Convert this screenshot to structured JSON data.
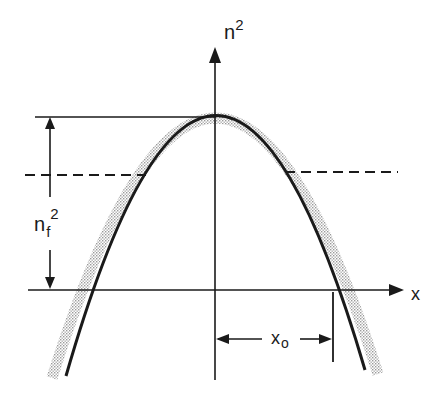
{
  "diagram": {
    "type": "refractive-index-profile",
    "labels": {
      "vertical_axis": "n",
      "vertical_axis_sup": "2",
      "horizontal_axis": "x",
      "left_dimension": "n",
      "left_dimension_sub": "f",
      "left_dimension_sup": "2",
      "bottom_dimension": "x",
      "bottom_dimension_sub": "o"
    },
    "elements": [
      {
        "name": "parabolic-profile-curve",
        "style": "solid"
      },
      {
        "name": "shaded-tolerance-band",
        "style": "stippled-gray"
      },
      {
        "name": "effective-index-level",
        "style": "dashed"
      },
      {
        "name": "peak-reference-line",
        "style": "solid"
      },
      {
        "name": "nf2-dimension-arrow",
        "style": "double-arrow"
      },
      {
        "name": "xo-dimension-arrow",
        "style": "double-arrow"
      }
    ],
    "colors": {
      "ink": "#1a1a1a",
      "shade": "#c8c8c8",
      "background": "#ffffff"
    }
  }
}
